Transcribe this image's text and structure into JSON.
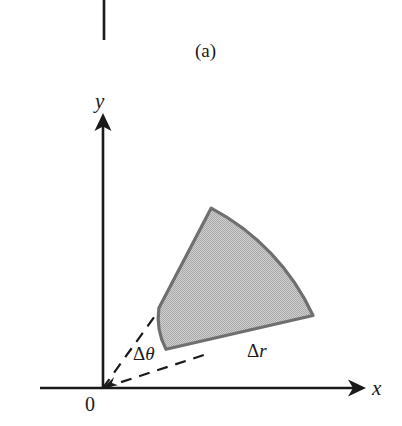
{
  "figure": {
    "panel_label": "(a)",
    "background_color": "#ffffff",
    "ink_color": "#1a1a1a",
    "axes": {
      "x_label": "x",
      "y_label": "y",
      "origin_label": "0",
      "origin_px": [
        103,
        388
      ],
      "x_axis_end_px": [
        366,
        388
      ],
      "y_axis_top_px": [
        103,
        114
      ]
    },
    "region": {
      "name": "polar-area-element",
      "fill_color": "#c3c3c3",
      "stroke_color": "#6b6b6b",
      "inner_radius_px": 68,
      "outer_radius_px": 230,
      "angle_start_deg": 22,
      "angle_end_deg": 62,
      "corners_px": {
        "inner_left": [
          158,
          312
        ],
        "inner_right": [
          200,
          352
        ],
        "outer_left": [
          228,
          203
        ],
        "outer_right": [
          313,
          315
        ]
      }
    },
    "annotations": [
      {
        "name": "delta-theta",
        "delta": "Δ",
        "symbol": "θ",
        "text": "Δθ",
        "x": 133,
        "y": 344
      },
      {
        "name": "delta-r",
        "delta": "Δ",
        "symbol": "r",
        "text": "Δr",
        "x": 247,
        "y": 341
      }
    ],
    "dashed_rays": [
      {
        "name": "ray-upper-angle-bound",
        "from_px": [
          103,
          388
        ],
        "to_px": [
          158,
          312
        ]
      },
      {
        "name": "ray-lower-angle-bound",
        "from_px": [
          103,
          388
        ],
        "to_px": [
          205,
          355
        ]
      }
    ],
    "top_rule": {
      "name": "panel-divider-rule",
      "x": 104,
      "y_start": 0,
      "y_end": 40
    }
  }
}
